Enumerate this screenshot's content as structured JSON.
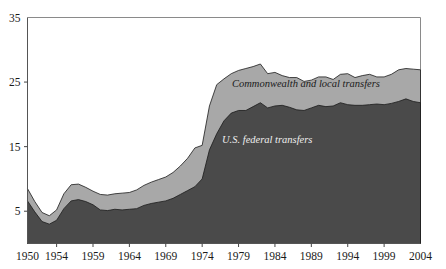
{
  "chart_data": {
    "type": "area",
    "title": "",
    "subtitle": "",
    "xlabel": "",
    "ylabel": "",
    "stacked": true,
    "grid": false,
    "legend_position": "inline-annotation",
    "xlim": [
      1950,
      2004
    ],
    "ylim": [
      0,
      35
    ],
    "ytick_labels": [
      "35",
      "25",
      "15",
      "5"
    ],
    "ytick_values": [
      35,
      25,
      15,
      5
    ],
    "xtick_labels": [
      "1950",
      "1954",
      "1959",
      "1964",
      "1969",
      "1974",
      "1979",
      "1984",
      "1989",
      "1994",
      "1999",
      "2004"
    ],
    "xtick_values": [
      1950,
      1954,
      1959,
      1964,
      1969,
      1974,
      1979,
      1984,
      1989,
      1994,
      1999,
      2004
    ],
    "x": [
      1950,
      1951,
      1952,
      1953,
      1954,
      1955,
      1956,
      1957,
      1958,
      1959,
      1960,
      1961,
      1962,
      1963,
      1964,
      1965,
      1966,
      1967,
      1968,
      1969,
      1970,
      1971,
      1972,
      1973,
      1974,
      1975,
      1976,
      1977,
      1978,
      1979,
      1980,
      1981,
      1982,
      1983,
      1984,
      1985,
      1986,
      1987,
      1988,
      1989,
      1990,
      1991,
      1992,
      1993,
      1994,
      1995,
      1996,
      1997,
      1998,
      1999,
      2000,
      2001,
      2002,
      2003,
      2004
    ],
    "series": [
      {
        "name": "U.S. federal transfers",
        "color": "#4a4a4a",
        "label_annotation": "U.S. federal transfers",
        "values": [
          6.6,
          4.9,
          3.4,
          3.0,
          3.6,
          5.4,
          6.6,
          6.8,
          6.5,
          6.0,
          5.2,
          5.1,
          5.3,
          5.2,
          5.3,
          5.4,
          5.9,
          6.2,
          6.4,
          6.6,
          7.0,
          7.6,
          8.2,
          8.8,
          10.0,
          14.5,
          17.0,
          19.0,
          20.2,
          20.6,
          20.6,
          21.2,
          21.8,
          21.0,
          21.3,
          21.4,
          21.1,
          20.7,
          20.6,
          21.0,
          21.4,
          21.2,
          21.3,
          21.8,
          21.5,
          21.4,
          21.4,
          21.5,
          21.6,
          21.5,
          21.7,
          22.0,
          22.4,
          22.0,
          21.8
        ]
      },
      {
        "name": "Commonwealth and local transfers",
        "color": "#a8a8a8",
        "label_annotation": "Commonwealth and local transfers",
        "values": [
          1.9,
          1.6,
          1.4,
          1.3,
          1.6,
          2.3,
          2.5,
          2.4,
          2.2,
          2.1,
          2.4,
          2.4,
          2.4,
          2.6,
          2.6,
          2.9,
          3.1,
          3.3,
          3.5,
          3.7,
          4.0,
          4.4,
          5.0,
          6.0,
          5.2,
          6.8,
          7.6,
          6.5,
          6.1,
          6.2,
          6.5,
          6.2,
          6.0,
          5.3,
          5.2,
          4.6,
          4.6,
          5.0,
          4.5,
          4.3,
          4.4,
          4.6,
          4.1,
          4.4,
          4.8,
          4.3,
          4.6,
          4.7,
          4.2,
          4.3,
          4.5,
          4.9,
          4.7,
          5.0,
          5.1
        ]
      }
    ]
  }
}
